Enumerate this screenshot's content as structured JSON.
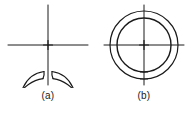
{
  "figure": {
    "type": "engineering-line-drawing",
    "background_color": "#ffffff",
    "line_color": "#1a1a1a",
    "panels": [
      {
        "id": "a",
        "caption": "(a)",
        "description": "split ring with gap at bottom",
        "ring": {
          "outer_radius": 34,
          "inner_radius": 27,
          "center_x": 48,
          "center_y": 43,
          "split": true,
          "gap_position": "bottom",
          "gap_angle_degrees": 16,
          "gap_ends": "flared"
        },
        "centerlines": {
          "horizontal": true,
          "vertical": true,
          "overhang": 6,
          "center_mark": "plus"
        }
      },
      {
        "id": "b",
        "caption": "(b)",
        "description": "closed continuous ring",
        "ring": {
          "outer_radius": 34,
          "inner_radius": 27,
          "center_x": 48,
          "center_y": 43,
          "split": false,
          "gap_position": "none",
          "gap_angle_degrees": 0,
          "gap_ends": "none"
        },
        "centerlines": {
          "horizontal": true,
          "vertical": true,
          "overhang": 6,
          "center_mark": "plus"
        }
      }
    ]
  }
}
